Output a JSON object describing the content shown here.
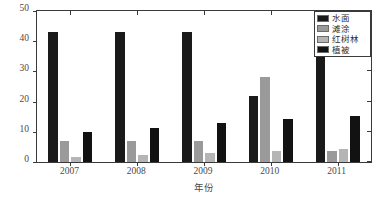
{
  "chart_data": {
    "type": "bar",
    "title": "",
    "subtitle": "",
    "xlabel": "年份",
    "ylabel": "面积（×10⁴m²）",
    "ylabel_base": "面积（×10",
    "ylabel_exp": "4",
    "ylabel_tail": "m",
    "ylabel_exp2": "2",
    "ylabel_close": "）",
    "categories": [
      "2007",
      "2008",
      "2009",
      "2010",
      "2011"
    ],
    "ylim": [
      0,
      50
    ],
    "yticks": [
      0,
      10,
      20,
      30,
      40,
      50
    ],
    "ytick_labels": [
      "0",
      "10",
      "20",
      "30",
      "40",
      "50"
    ],
    "grid": false,
    "legend_position": "top-right",
    "series": [
      {
        "name": "水面",
        "color": "#1a1a1a",
        "values": [
          43.0,
          43.0,
          43.0,
          22.0,
          46.8
        ]
      },
      {
        "name": "滩涂",
        "color": "#9a9a9a",
        "values": [
          7.0,
          7.0,
          7.0,
          28.2,
          3.6
        ]
      },
      {
        "name": "红树林",
        "color": "#b5b5b5",
        "values": [
          1.7,
          2.2,
          3.0,
          3.7,
          4.2
        ]
      },
      {
        "name": "植被",
        "color": "#121212",
        "values": [
          10.0,
          11.2,
          13.0,
          14.4,
          15.2
        ]
      }
    ]
  },
  "axes": {
    "frame_color": "#3a3a3a",
    "tick_color": "#3a3a3a",
    "label_color": "#4a4a4a"
  }
}
